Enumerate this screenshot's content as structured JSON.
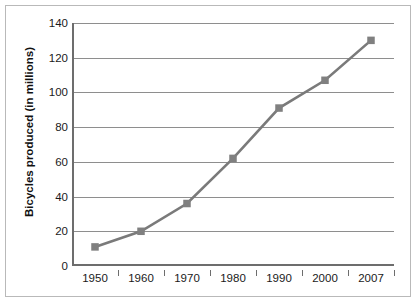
{
  "chart_data": {
    "type": "line",
    "title": "",
    "xlabel": "",
    "ylabel": "Bicycles produced (in millions)",
    "categories": [
      "1950",
      "1960",
      "1970",
      "1980",
      "1990",
      "2000",
      "2007"
    ],
    "values": [
      11,
      20,
      36,
      62,
      91,
      107,
      130
    ],
    "series": [
      {
        "name": "Bicycles produced",
        "values": [
          11,
          20,
          36,
          62,
          91,
          107,
          130
        ]
      }
    ],
    "ylim": [
      0,
      140
    ],
    "yticks": [
      0,
      20,
      40,
      60,
      80,
      100,
      120,
      140
    ],
    "ytick_labels": [
      "0",
      "20",
      "40",
      "60",
      "80",
      "100",
      "120",
      "140"
    ],
    "grid": true,
    "grid_axis": "y",
    "legend": false,
    "legend_position": "none",
    "marker": "square",
    "colors": {
      "line": "#7a7a7a",
      "marker": "#808080",
      "grid": "#8e8e8e",
      "axis": "#6d6d6d",
      "text": "#1a1a1a",
      "background": "#ffffff",
      "frame": "#b9b9b9"
    }
  }
}
